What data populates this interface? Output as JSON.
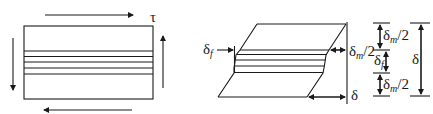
{
  "figure": {
    "left_panel": {
      "title": "undeformed element under shear",
      "shear_label": "τ",
      "fiber_layer_count": 5
    },
    "right_panel": {
      "title": "deformed element",
      "labels": {
        "fiber_displacement": "δ",
        "fiber_displacement_sub": "f",
        "matrix_half_displacement": "δ",
        "matrix_half_displacement_sub": "m",
        "matrix_half_suffix": "/2",
        "total_displacement": "δ"
      }
    },
    "dimension_stack": {
      "segments": [
        {
          "symbol": "δ",
          "sub": "m",
          "suffix": "/2"
        },
        {
          "symbol": "δ",
          "sub": "f",
          "suffix": ""
        },
        {
          "symbol": "δ",
          "sub": "m",
          "suffix": "/2"
        }
      ],
      "total": "δ"
    },
    "colors": {
      "stroke": "#1a1a1a",
      "background": "#ffffff"
    }
  }
}
